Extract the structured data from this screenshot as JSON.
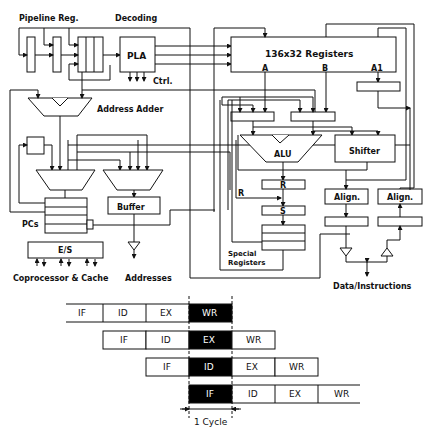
{
  "diagram": {
    "labels": {
      "pipeline_reg": "Pipeline Reg.",
      "decoding": "Decoding",
      "pla": "PLA",
      "ctrl": "Ctrl.",
      "address_adder": "Address Adder",
      "registers": "136x32 Registers",
      "port_a": "A",
      "port_b": "B",
      "port_a1": "A1",
      "alu": "ALU",
      "shifter": "Shifter",
      "reg_r": "R",
      "reg_s": "S",
      "r_input": "R",
      "special_registers_line1": "Special",
      "special_registers_line2": "Registers",
      "align_left": "Align.",
      "align_right": "Align.",
      "buffer": "Buffer",
      "pcs": "PCs",
      "es": "E/S",
      "coprocessor_cache": "Coprocessor & Cache",
      "addresses": "Addresses",
      "data_instructions": "Data/Instructions"
    },
    "pipeline": {
      "rows": [
        [
          "IF",
          "ID",
          "EX",
          "WR"
        ],
        [
          "IF",
          "ID",
          "EX",
          "WR"
        ],
        [
          "IF",
          "ID",
          "EX",
          "WR"
        ],
        [
          "IF",
          "ID",
          "EX",
          "WR"
        ]
      ],
      "highlighted_column_labels": [
        "WR",
        "EX",
        "ID",
        "IF"
      ],
      "cycle_label": "1 Cycle"
    }
  }
}
